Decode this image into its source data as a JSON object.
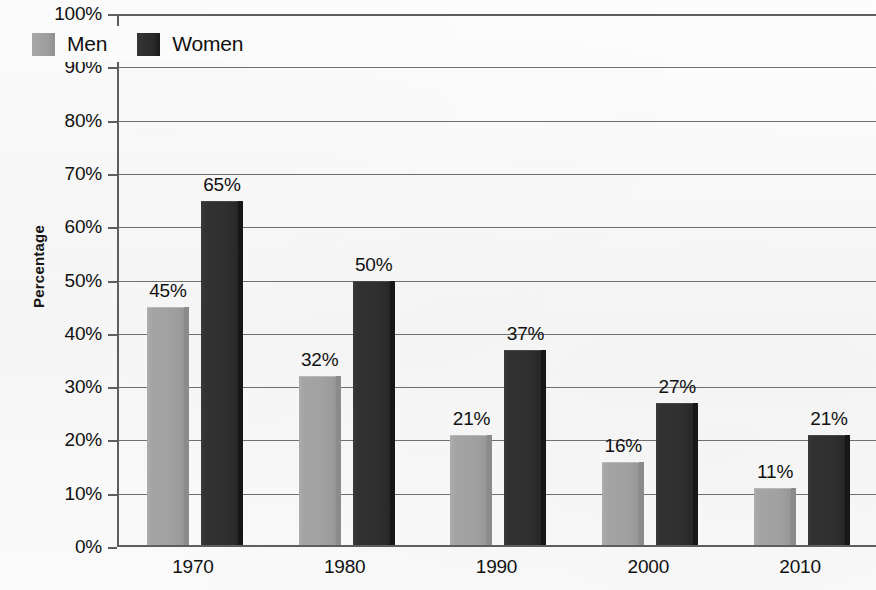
{
  "chart_data": {
    "type": "bar",
    "title": "",
    "xlabel": "",
    "ylabel": "Percentage",
    "categories": [
      "1970",
      "1980",
      "1990",
      "2000",
      "2010"
    ],
    "series": [
      {
        "name": "Men",
        "color": "#9c9c9c",
        "values": [
          45,
          32,
          21,
          16,
          11
        ],
        "labels": [
          "45%",
          "32%",
          "21%",
          "16%",
          "11%"
        ]
      },
      {
        "name": "Women",
        "color": "#2a2a2a",
        "values": [
          65,
          50,
          37,
          27,
          21
        ],
        "labels": [
          "65%",
          "50%",
          "37%",
          "27%",
          "21%"
        ]
      }
    ],
    "ylim": [
      0,
      100
    ],
    "ytick_values": [
      0,
      10,
      20,
      30,
      40,
      50,
      60,
      70,
      80,
      90,
      100
    ],
    "ytick_labels": [
      "0%",
      "10%",
      "20%",
      "30%",
      "40%",
      "50%",
      "60%",
      "70%",
      "80%",
      "90%",
      "100%"
    ],
    "grid": true,
    "legend_position": "top-left"
  },
  "legend": {
    "items": [
      {
        "label": "Men",
        "swatch": "men-swatch"
      },
      {
        "label": "Women",
        "swatch": "women-swatch"
      }
    ]
  },
  "axes": {
    "y_title": "Percentage"
  }
}
